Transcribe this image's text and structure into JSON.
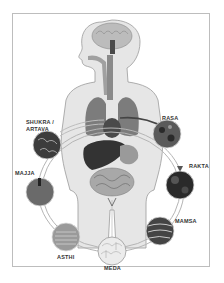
{
  "figure": {
    "colors": {
      "body_fill": "#e6e6e6",
      "body_stroke": "#9a9a9a",
      "organ_dark": "#3a3a3a",
      "organ_mid": "#8a8a8a",
      "ring": "#b5b5b5",
      "frame": "#bdbdbd",
      "label": "#333333"
    }
  },
  "dhatus": [
    {
      "id": "shukra",
      "label_line1": "SHUKRA /",
      "label_line2": "ARTAVA",
      "fill": "#3c3c3c"
    },
    {
      "id": "rasa",
      "label_line1": "RASA",
      "fill": "#5a5a5a"
    },
    {
      "id": "rakta",
      "label_line1": "RAKTA",
      "fill": "#2a2a2a"
    },
    {
      "id": "mamsa",
      "label_line1": "MAMSA",
      "fill": "#444444"
    },
    {
      "id": "meda",
      "label_line1": "MEDA",
      "fill": "#ececec"
    },
    {
      "id": "asthi",
      "label_line1": "ASTHI",
      "fill": "#9a9a9a"
    },
    {
      "id": "majja",
      "label_line1": "MAJJA",
      "fill": "#6a6a6a"
    }
  ]
}
